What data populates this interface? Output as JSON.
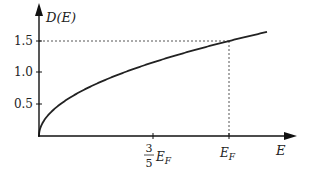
{
  "chart_data": {
    "type": "line",
    "title": "",
    "xlabel": "E",
    "ylabel": "D(E)",
    "series": [
      {
        "name": "D(E) = 1.5 sqrt(E/E_F)",
        "x": [
          0,
          0.05,
          0.1,
          0.2,
          0.3,
          0.4,
          0.5,
          0.6,
          0.7,
          0.8,
          0.9,
          1.0,
          1.1,
          1.2
        ],
        "values": [
          0,
          0.335,
          0.474,
          0.671,
          0.822,
          0.949,
          1.061,
          1.162,
          1.255,
          1.342,
          1.423,
          1.5,
          1.573,
          1.643
        ]
      }
    ],
    "yticks": [
      "0.5",
      "1.0",
      "1.5"
    ],
    "ytick_values": [
      0.5,
      1.0,
      1.5
    ],
    "xticks": [
      "3/5 E_F",
      "E_F"
    ],
    "xtick_values": [
      0.6,
      1.0
    ],
    "annotations": [
      {
        "type": "dotted-guide",
        "from": "y-axis at 1.5",
        "to": "curve at E_F"
      },
      {
        "type": "dotted-guide",
        "from": "x-axis at E_F",
        "to": "curve at E_F"
      }
    ],
    "xlim": [
      0,
      1.28
    ],
    "ylim": [
      0,
      2.0
    ],
    "grid": false,
    "legend": "none"
  },
  "labels": {
    "y_axis": "D(E)",
    "x_axis": "E",
    "ytick_05": "0.5",
    "ytick_10": "1.0",
    "ytick_15": "1.5",
    "xtick_frac_num": "3",
    "xtick_frac_den": "5",
    "xtick_ef": "E",
    "xtick_ef_sub": "F"
  },
  "colors": {
    "axis": "#111111",
    "curve": "#222222",
    "guide": "#555555"
  }
}
